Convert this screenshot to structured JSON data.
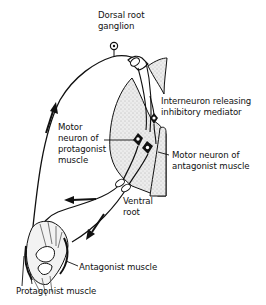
{
  "diagram": {
    "type": "reflex-arc-reciprocal-inhibition",
    "colors": {
      "ink": "#111111",
      "stipple_fill": "#e4e4e4",
      "background": "#ffffff"
    },
    "labels": {
      "dorsal_root_ganglion": "Dorsal root\nganglion",
      "interneuron": "Interneuron releasing\ninhibitory mediator",
      "motor_neuron_protagonist": "Motor\nneuron of\nprotagonist\nmuscle",
      "motor_neuron_antagonist": "Motor neuron of\nantagonist muscle",
      "ventral_root": "Ventral\nroot",
      "antagonist_muscle": "Antagonist muscle",
      "protagonist_muscle": "Protagonist muscle"
    },
    "nodes": [
      {
        "id": "dorsal-root-ganglion",
        "label_ref": "dorsal_root_ganglion"
      },
      {
        "id": "interneuron",
        "label_ref": "interneuron"
      },
      {
        "id": "motor-neuron-protagonist",
        "label_ref": "motor_neuron_protagonist"
      },
      {
        "id": "motor-neuron-antagonist",
        "label_ref": "motor_neuron_antagonist"
      },
      {
        "id": "ventral-root",
        "label_ref": "ventral_root"
      },
      {
        "id": "antagonist-muscle",
        "label_ref": "antagonist_muscle"
      },
      {
        "id": "protagonist-muscle",
        "label_ref": "protagonist_muscle"
      }
    ],
    "edges": [
      {
        "from": "protagonist-muscle",
        "to": "dorsal-root-ganglion",
        "kind": "sensory-afferent",
        "arrow": "up"
      },
      {
        "from": "dorsal-root-ganglion",
        "to": "interneuron",
        "kind": "spinal-cord-entry"
      },
      {
        "from": "dorsal-root-ganglion",
        "to": "motor-neuron-protagonist",
        "kind": "excitatory-synapse"
      },
      {
        "from": "interneuron",
        "to": "motor-neuron-antagonist",
        "kind": "inhibitory-synapse"
      },
      {
        "from": "motor-neuron-protagonist",
        "to": "protagonist-muscle",
        "kind": "motor-efferent",
        "via": "ventral-root",
        "arrow": "left"
      },
      {
        "from": "motor-neuron-antagonist",
        "to": "antagonist-muscle",
        "kind": "motor-efferent",
        "via": "ventral-root",
        "arrow": "down-left"
      }
    ]
  }
}
